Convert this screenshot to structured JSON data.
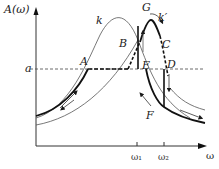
{
  "diagram": {
    "y_axis_label": "A(ω)",
    "x_axis_label": "ω",
    "level_label": "a",
    "points": {
      "A": "A",
      "B": "B",
      "C": "C",
      "D": "D",
      "E": "E",
      "F": "F",
      "G": "G"
    },
    "curve_labels": {
      "k": "k",
      "k_prime": "k′"
    },
    "ticks": {
      "w1": "ω₁",
      "w2": "ω₂"
    },
    "colors": {
      "line": "#1a1a1a",
      "thin": "#555555",
      "dashed": "#333333"
    }
  }
}
